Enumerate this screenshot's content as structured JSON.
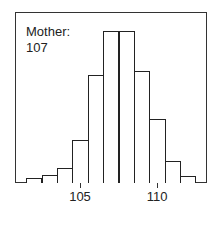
{
  "chart_data": {
    "type": "bar",
    "title": "",
    "xlabel": "",
    "ylabel": "",
    "categories": [
      102,
      103,
      104,
      105,
      106,
      107,
      108,
      109,
      110,
      111,
      112
    ],
    "values": [
      5,
      8,
      15,
      43,
      108,
      152,
      152,
      112,
      64,
      22,
      7
    ],
    "x_ticks": [
      105,
      110
    ],
    "y_ticks": [],
    "grid": false,
    "annotation": {
      "line1": "Mother:",
      "line2": "107"
    },
    "bin_width": 1
  }
}
